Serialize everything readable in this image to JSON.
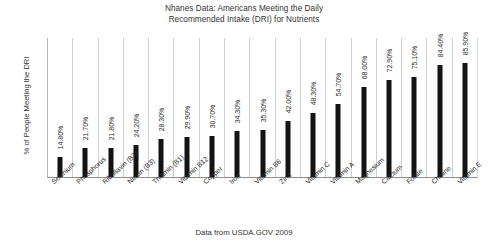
{
  "chart_data": {
    "type": "bar",
    "title": "Nhanes Data: Americans Meeting the Daily Recommended Intake (DRI) for Nutrients",
    "title_lines": [
      "Nhanes Data: Americans Meeting the Daily",
      "Recommended Intake (DRI) for Nutrients"
    ],
    "subtitle": "",
    "xlabel": "",
    "ylabel": "% of People Meeting the DRI",
    "ylim": [
      0,
      100
    ],
    "grid": true,
    "grid_orientation": "vertical-category-separators",
    "legend": false,
    "legend_position": "none",
    "bar_color": "#131313",
    "source_note": "Data from USDA.GOV 2009",
    "categories": [
      "Selenium",
      "Phosphorus",
      "Riboflavin (B2)",
      "Niacin (B3)",
      "Thiamin (B1)",
      "Vitamin B12",
      "Copper",
      "Iron",
      "Vitamin B6",
      "Zinc",
      "Vitamin C",
      "Vitamin A",
      "Magnesium",
      "Calcium",
      "Folate",
      "Choline",
      "Vitamin E"
    ],
    "values": [
      14.8,
      21.7,
      21.8,
      24.2,
      28.3,
      29.9,
      30.7,
      34.3,
      35.3,
      42.0,
      48.3,
      54.7,
      68.0,
      72.9,
      75.1,
      84.4,
      85.9
    ],
    "value_labels": [
      "14.80%",
      "21.70%",
      "21.80%",
      "24.20%",
      "28.30%",
      "29.90%",
      "30.70%",
      "34.30%",
      "35.30%",
      "42.00%",
      "48.30%",
      "54.70%",
      "68.00%",
      "72.90%",
      "75.10%",
      "84.40%",
      "85.90%"
    ]
  }
}
